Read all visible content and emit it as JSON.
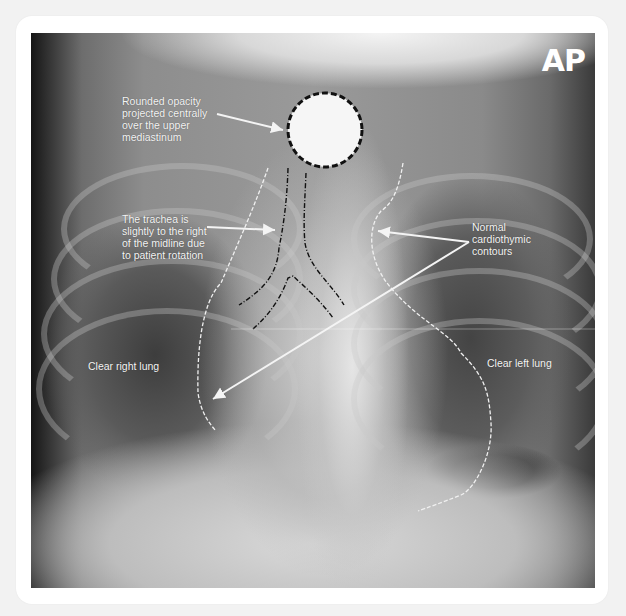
{
  "figure": {
    "view_label": "AP",
    "colors": {
      "annotation_text": "#f4f4f4",
      "arrow": "#f4f4f4",
      "dashed_outline_dark": "#111111",
      "dashed_outline_light": "#f0f0f0",
      "opacity_fill": "#f6f6f6",
      "card_background": "#ffffff",
      "page_background": "#f2f2f2"
    },
    "annotations": [
      {
        "id": "rounded-opacity",
        "text": "Rounded opacity\nprojected centrally\nover the upper\nmediastinum"
      },
      {
        "id": "trachea",
        "text": "The trachea is\nslightly to the right\nof the midline due\nto patient rotation"
      },
      {
        "id": "cardiothymic",
        "text": "Normal\ncardiothymic\ncontours"
      },
      {
        "id": "right-lung",
        "text": "Clear right lung"
      },
      {
        "id": "left-lung",
        "text": "Clear left lung"
      }
    ]
  }
}
